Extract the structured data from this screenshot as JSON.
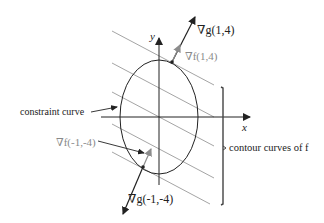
{
  "figure": {
    "axes": {
      "x_label": "x",
      "y_label": "y"
    },
    "labels": {
      "grad_g_top": "∇g(1,4)",
      "grad_f_top": "∇f(1,4)",
      "constraint_curve": "constraint curve",
      "grad_f_bottom": "∇f(-1,-4)",
      "grad_g_bottom": "∇g(-1,-4)",
      "contour_curves": "contour curves of f"
    },
    "colors": {
      "black": "#222222",
      "gray_text": "#8a8a8a",
      "contour_line": "#9a9a9a",
      "gray_arrow": "#8c8c8c"
    },
    "points": [
      {
        "name": "tangent-point-top",
        "label": "(1,4)"
      },
      {
        "name": "tangent-point-bottom",
        "label": "(-1,-4)"
      }
    ]
  }
}
